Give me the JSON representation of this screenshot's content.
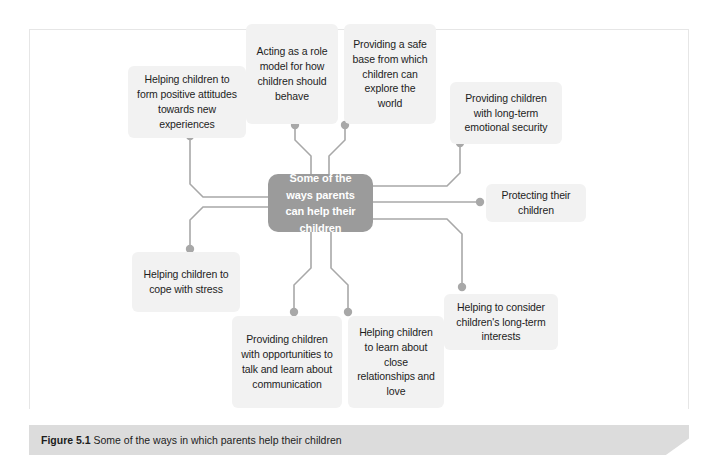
{
  "figure": {
    "caption_label": "Figure 5.1",
    "caption_text": " Some of the ways in which parents help their children",
    "center_node": {
      "id": "center",
      "label": "Some of the ways parents can help their children"
    },
    "colors": {
      "center_node_fill": "#9b9b9b",
      "center_node_text": "#ffffff",
      "node_fill": "#f2f2f2",
      "node_text": "#1d1d1d",
      "connector": "#a8a8a8",
      "frame_border": "#e6e6e6",
      "caption_bar": "#dcdcdc",
      "page_background": "#ffffff"
    },
    "nodes": [
      {
        "id": "form-positive-attitudes",
        "label": "Helping children to form positive attitudes towards new experiences"
      },
      {
        "id": "acting-as-role-model",
        "label": "Acting as a role model for how children should behave"
      },
      {
        "id": "providing-safe-base",
        "label": "Providing a safe base from which children can explore the world"
      },
      {
        "id": "long-term-emotional-security",
        "label": "Providing children with long-term emotional security"
      },
      {
        "id": "protecting-their-children",
        "label": "Protecting their children"
      },
      {
        "id": "consider-long-term-interests",
        "label": "Helping to consider children's long-term interests"
      },
      {
        "id": "learn-close-relationships",
        "label": "Helping children to learn about close relationships and love"
      },
      {
        "id": "opportunities-to-talk",
        "label": "Providing children with opportunities to talk and learn about communication"
      },
      {
        "id": "cope-with-stress",
        "label": "Helping children to cope with stress"
      }
    ]
  }
}
